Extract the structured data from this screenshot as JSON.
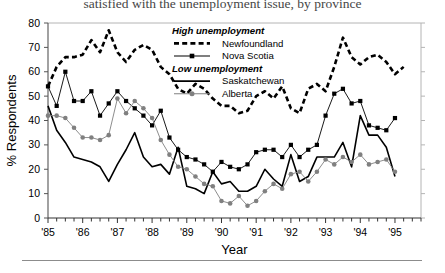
{
  "caption": "satisfied with the unemployment issue, by province",
  "chart_data": {
    "type": "line",
    "title": "",
    "xlabel": "Year",
    "ylabel": "% Respondents",
    "ylim": [
      0,
      80
    ],
    "yticks": [
      0,
      10,
      20,
      30,
      40,
      50,
      60,
      70,
      80
    ],
    "xlim": [
      1985.0,
      1995.75
    ],
    "xticks": [
      "'85",
      "'86",
      "'87",
      "'88",
      "'89",
      "'90",
      "'91",
      "'92",
      "'93",
      "'94",
      "'95"
    ],
    "xtick_values": [
      1985,
      1986,
      1987,
      1988,
      1989,
      1990,
      1991,
      1992,
      1993,
      1994,
      1995
    ],
    "minor_tick_interval": 0.25,
    "grid": false,
    "legend_position": "upper-center",
    "legend_groups": [
      {
        "heading": "High unemployment",
        "entries": [
          "Newfoundland",
          "Nova Scotia"
        ]
      },
      {
        "heading": "Low unemployment",
        "entries": [
          "Saskatchewan",
          "Alberta"
        ]
      }
    ],
    "series": [
      {
        "name": "Newfoundland",
        "group": "High unemployment",
        "style": "dashed",
        "marker": "none",
        "color": "#000000",
        "x": [
          1985.0,
          1985.25,
          1985.5,
          1985.75,
          1986.0,
          1986.25,
          1986.5,
          1986.75,
          1987.0,
          1987.25,
          1987.5,
          1987.75,
          1988.0,
          1988.25,
          1988.5,
          1988.75,
          1989.0,
          1989.25,
          1989.5,
          1989.75,
          1990.0,
          1990.25,
          1990.5,
          1990.75,
          1991.0,
          1991.25,
          1991.5,
          1991.75,
          1992.0,
          1992.25,
          1992.5,
          1992.75,
          1993.0,
          1993.25,
          1993.5,
          1993.75,
          1994.0,
          1994.25,
          1994.5,
          1994.75,
          1995.0,
          1995.25
        ],
        "values": [
          54,
          62,
          66,
          66,
          67,
          73,
          68,
          77,
          68,
          64,
          69,
          71,
          69,
          62,
          59,
          53,
          51,
          55,
          53,
          49,
          46,
          46,
          43,
          44,
          50,
          52,
          49,
          54,
          45,
          43,
          53,
          55,
          52,
          62,
          74,
          66,
          63,
          66,
          67,
          64,
          59,
          62
        ]
      },
      {
        "name": "Nova Scotia",
        "group": "High unemployment",
        "style": "solid-thin",
        "marker": "square",
        "color": "#000000",
        "x": [
          1985.0,
          1985.25,
          1985.5,
          1985.75,
          1986.0,
          1986.25,
          1986.5,
          1986.75,
          1987.0,
          1987.25,
          1987.5,
          1987.75,
          1988.0,
          1988.25,
          1988.5,
          1988.75,
          1989.0,
          1989.25,
          1989.5,
          1989.75,
          1990.0,
          1990.25,
          1990.5,
          1990.75,
          1991.0,
          1991.25,
          1991.5,
          1991.75,
          1992.0,
          1992.25,
          1992.5,
          1992.75,
          1993.0,
          1993.25,
          1993.5,
          1993.75,
          1994.0,
          1994.25,
          1994.5,
          1994.75,
          1995.0
        ],
        "values": [
          54,
          46,
          60,
          48,
          48,
          52,
          42,
          47,
          52,
          48,
          45,
          42,
          38,
          44,
          33,
          28,
          25,
          24,
          22,
          19,
          23,
          21,
          20,
          22,
          27,
          28,
          28,
          25,
          30,
          25,
          28,
          30,
          42,
          51,
          53,
          47,
          48,
          38,
          37,
          36,
          41
        ]
      },
      {
        "name": "Saskatchewan",
        "group": "Low unemployment",
        "style": "solid-thick",
        "marker": "none",
        "color": "#000000",
        "x": [
          1985.0,
          1985.25,
          1985.5,
          1985.75,
          1986.0,
          1986.25,
          1986.5,
          1986.75,
          1987.0,
          1987.25,
          1987.5,
          1987.75,
          1988.0,
          1988.25,
          1988.5,
          1988.75,
          1989.0,
          1989.25,
          1989.5,
          1989.75,
          1990.0,
          1990.25,
          1990.5,
          1990.75,
          1991.0,
          1991.25,
          1991.5,
          1991.75,
          1992.0,
          1992.25,
          1992.5,
          1992.75,
          1993.0,
          1993.25,
          1993.5,
          1993.75,
          1994.0,
          1994.25,
          1994.5,
          1994.75,
          1995.0
        ],
        "values": [
          46,
          36,
          31,
          25,
          24,
          23,
          21,
          15,
          22,
          28,
          35,
          25,
          21,
          22,
          18,
          29,
          13,
          12,
          10,
          19,
          14,
          15,
          11,
          11,
          13,
          20,
          16,
          13,
          26,
          15,
          17,
          25,
          25,
          25,
          31,
          21,
          42,
          34,
          34,
          29,
          17
        ]
      },
      {
        "name": "Alberta",
        "group": "Low unemployment",
        "style": "solid-thin",
        "marker": "circle",
        "color": "#808080",
        "x": [
          1985.0,
          1985.25,
          1985.5,
          1985.75,
          1986.0,
          1986.25,
          1986.5,
          1986.75,
          1987.0,
          1987.25,
          1987.5,
          1987.75,
          1988.0,
          1988.25,
          1988.5,
          1988.75,
          1989.0,
          1989.25,
          1989.5,
          1989.75,
          1990.0,
          1990.25,
          1990.5,
          1990.75,
          1991.0,
          1991.25,
          1991.5,
          1991.75,
          1992.0,
          1992.25,
          1992.5,
          1992.75,
          1993.0,
          1993.25,
          1993.5,
          1993.75,
          1994.0,
          1994.25,
          1994.5,
          1994.75,
          1995.0
        ],
        "values": [
          42,
          42,
          41,
          37,
          33,
          33,
          32,
          34,
          49,
          43,
          48,
          45,
          41,
          32,
          26,
          21,
          20,
          17,
          14,
          13,
          7,
          6,
          9,
          5,
          7,
          11,
          14,
          12,
          18,
          19,
          15,
          19,
          24,
          22,
          25,
          23,
          26,
          22,
          23,
          24,
          19
        ]
      }
    ]
  }
}
